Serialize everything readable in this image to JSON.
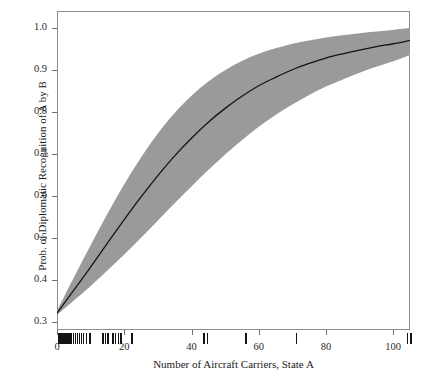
{
  "chart_data": {
    "type": "line",
    "title": "",
    "subtitle": "",
    "xlabel": "Number of Aircraft Carriers, State A",
    "ylabel": "Prob. of Diplomatic Recognition of A by B",
    "xlim": [
      0,
      105
    ],
    "ylim": [
      0.28,
      1.04
    ],
    "grid": false,
    "legend": null,
    "x_ticks": [
      0,
      20,
      40,
      60,
      80,
      100
    ],
    "x_tick_labels": [
      "0",
      "20",
      "40",
      "60",
      "80",
      "100"
    ],
    "y_ticks": [
      0.3,
      0.4,
      0.5,
      0.6,
      0.7,
      0.8,
      0.9,
      1.0
    ],
    "y_tick_labels": [
      "0.3",
      "0.4",
      "0.5",
      "0.6",
      "0.7",
      "0.8",
      "0.9",
      "1.0"
    ],
    "colors": {
      "line": "#141414",
      "band": "#9a9a9a",
      "frame": "#8c8c8c",
      "rug": "#141414",
      "background": "#ffffff"
    },
    "x": [
      0,
      5,
      10,
      15,
      20,
      25,
      30,
      35,
      40,
      45,
      50,
      55,
      60,
      65,
      70,
      75,
      80,
      85,
      90,
      95,
      100,
      105
    ],
    "series": [
      {
        "name": "predicted probability",
        "type": "line",
        "values": [
          0.32,
          0.375,
          0.43,
          0.487,
          0.543,
          0.597,
          0.648,
          0.695,
          0.737,
          0.775,
          0.808,
          0.837,
          0.862,
          0.882,
          0.9,
          0.915,
          0.928,
          0.938,
          0.947,
          0.955,
          0.962,
          0.97
        ]
      },
      {
        "name": "confidence band upper",
        "type": "band-upper",
        "values": [
          0.325,
          0.405,
          0.482,
          0.557,
          0.627,
          0.691,
          0.748,
          0.797,
          0.838,
          0.872,
          0.899,
          0.921,
          0.938,
          0.951,
          0.962,
          0.97,
          0.977,
          0.982,
          0.987,
          0.991,
          0.995,
          1.0
        ]
      },
      {
        "name": "confidence band lower",
        "type": "band-lower",
        "values": [
          0.316,
          0.35,
          0.385,
          0.422,
          0.46,
          0.5,
          0.541,
          0.582,
          0.622,
          0.661,
          0.698,
          0.732,
          0.764,
          0.792,
          0.817,
          0.84,
          0.86,
          0.877,
          0.893,
          0.907,
          0.92,
          0.935
        ]
      }
    ],
    "rug_values": [
      0.4,
      1.0,
      1.6,
      2.2,
      2.8,
      3.4,
      4.0,
      4.6,
      5.2,
      5.8,
      6.4,
      7.0,
      7.6,
      8.6,
      9.6,
      13.4,
      14.2,
      15.0,
      16.4,
      17.2,
      18.0,
      18.8,
      22.0,
      43.5,
      44.5,
      56.0,
      71.0,
      104.0,
      105.0
    ]
  },
  "axis": {
    "x_title": "Number of Aircraft Carriers, State A",
    "y_title": "Prob. of Diplomatic Recognition of A by B"
  }
}
